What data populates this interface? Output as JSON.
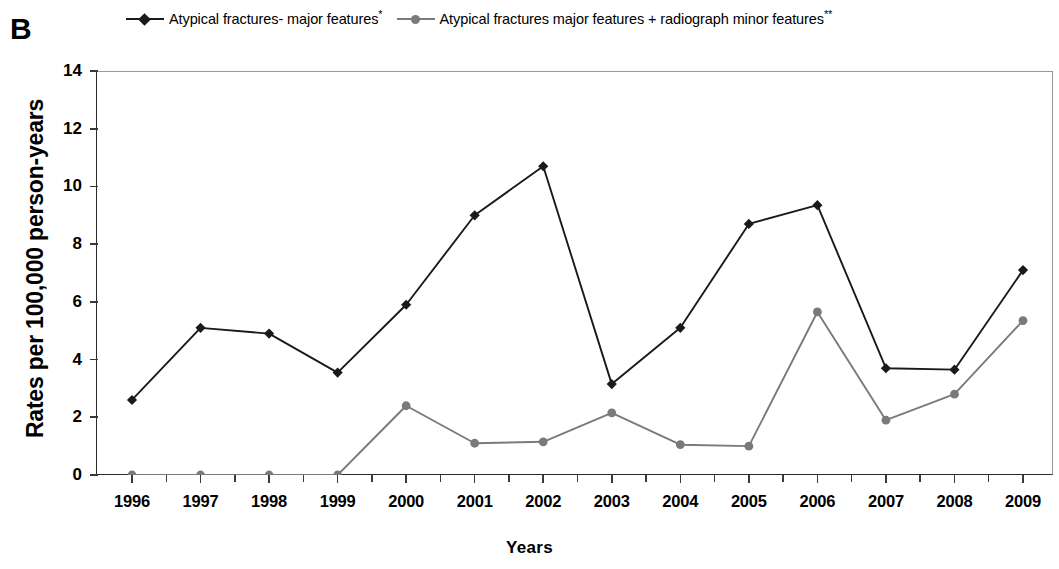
{
  "panel": {
    "label": "B"
  },
  "legend": {
    "position": "top",
    "entries": [
      {
        "label": "Atypical fractures- major features",
        "footnote": "*",
        "color": "#1a1a1a",
        "marker": "diamond",
        "marker_icon": "diamond-marker-icon"
      },
      {
        "label": "Atypical fractures major features + radiograph minor features",
        "footnote": "**",
        "color": "#7a7a7a",
        "marker": "circle",
        "marker_icon": "circle-marker-icon"
      }
    ]
  },
  "axes": {
    "ylabel": "Rates per 100,000 person-years",
    "xlabel": "Years",
    "yticks": [
      "0",
      "2",
      "4",
      "6",
      "8",
      "10",
      "12",
      "14"
    ],
    "xticks": [
      "1996",
      "1997",
      "1998",
      "1999",
      "2000",
      "2001",
      "2002",
      "2003",
      "2004",
      "2005",
      "2006",
      "2007",
      "2008",
      "2009"
    ]
  },
  "chart_data": {
    "type": "line",
    "title": "B",
    "xlabel": "Years",
    "ylabel": "Rates per 100,000 person-years",
    "categories": [
      1996,
      1997,
      1998,
      1999,
      2000,
      2001,
      2002,
      2003,
      2004,
      2005,
      2006,
      2007,
      2008,
      2009
    ],
    "series": [
      {
        "name": "Atypical fractures- major features*",
        "color": "#1a1a1a",
        "marker": "diamond",
        "values": [
          2.6,
          5.1,
          4.9,
          3.55,
          5.9,
          9.0,
          10.7,
          3.15,
          5.1,
          8.7,
          9.35,
          3.7,
          3.65,
          7.1
        ]
      },
      {
        "name": "Atypical fractures major features + radiograph minor features**",
        "color": "#7a7a7a",
        "marker": "circle",
        "values": [
          0.0,
          0.0,
          0.0,
          0.0,
          2.4,
          1.1,
          1.15,
          2.15,
          1.05,
          1.0,
          5.65,
          1.9,
          2.8,
          5.35
        ]
      }
    ],
    "ylim": [
      0,
      14
    ],
    "ytick_step": 2,
    "grid": false,
    "legend_position": "top"
  }
}
